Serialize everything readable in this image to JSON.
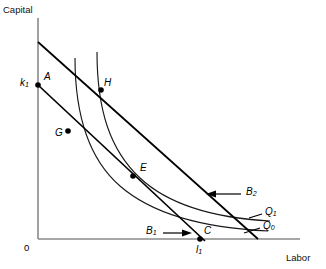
{
  "figure": {
    "type": "economics-isoquant-isocost-diagram",
    "axes": {
      "y_label": "Capital",
      "x_label": "Labor",
      "origin_label": "0",
      "y_tick_label": "k",
      "y_tick_sub": "1",
      "x_tick_label": "l",
      "x_tick_sub": "1"
    },
    "points": [
      {
        "id": "A",
        "label": "A",
        "x": 40,
        "y": 85,
        "marked": true
      },
      {
        "id": "H",
        "label": "H",
        "x": 101,
        "y": 90,
        "marked": true
      },
      {
        "id": "G",
        "label": "G",
        "x": 68,
        "y": 131,
        "marked": true
      },
      {
        "id": "E",
        "label": "E",
        "x": 133,
        "y": 176,
        "marked": true
      },
      {
        "id": "C",
        "label": "C",
        "x": 200,
        "y": 238,
        "marked": true
      }
    ],
    "isocost_lines": [
      {
        "id": "B2",
        "label": "B",
        "sub": "2",
        "note": "upper isocost"
      },
      {
        "id": "B1",
        "label": "B",
        "sub": "1",
        "note": "lower isocost"
      }
    ],
    "isoquants": [
      {
        "id": "Q1",
        "label": "Q",
        "sub": "1",
        "note": "upper isoquant"
      },
      {
        "id": "Q0",
        "label": "Q",
        "sub": "0",
        "note": "lower isoquant"
      }
    ],
    "colors": {
      "axis": "#8a8a8a",
      "line": "#000000",
      "curve": "#1a1a1a",
      "text": "#000000"
    }
  }
}
